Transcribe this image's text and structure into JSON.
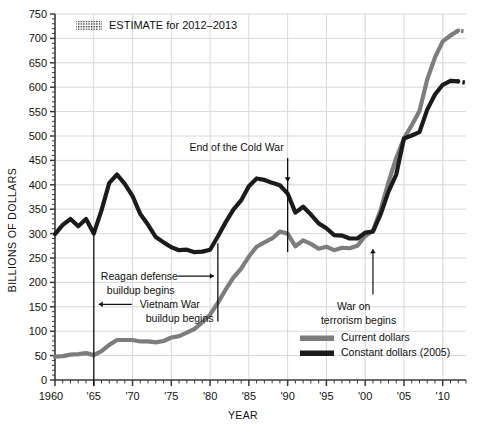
{
  "chart_data": {
    "type": "line",
    "title": "",
    "xlabel": "YEAR",
    "ylabel": "BILLIONS OF DOLLARS",
    "xlim": [
      1960,
      2013
    ],
    "ylim": [
      0,
      750
    ],
    "grid": true,
    "legend_position": "bottom-right",
    "y_ticks": [
      0,
      50,
      100,
      150,
      200,
      250,
      300,
      350,
      400,
      450,
      500,
      550,
      600,
      650,
      700,
      750
    ],
    "y_tick_labels": [
      "0",
      "50",
      "100",
      "150",
      "200",
      "250",
      "300",
      "350",
      "400",
      "450",
      "500",
      "550",
      "600",
      "650",
      "700",
      "750"
    ],
    "x_ticks": [
      1960,
      1965,
      1970,
      1975,
      1980,
      1985,
      1990,
      1995,
      2000,
      2005,
      2010
    ],
    "x_tick_labels": [
      "1960",
      "'65",
      "'70",
      "'75",
      "'80",
      "'85",
      "'90",
      "'95",
      "'00",
      "'05",
      "'10"
    ],
    "x": [
      1960,
      1961,
      1962,
      1963,
      1964,
      1965,
      1966,
      1967,
      1968,
      1969,
      1970,
      1971,
      1972,
      1973,
      1974,
      1975,
      1976,
      1977,
      1978,
      1979,
      1980,
      1981,
      1982,
      1983,
      1984,
      1985,
      1986,
      1987,
      1988,
      1989,
      1990,
      1991,
      1992,
      1993,
      1994,
      1995,
      1996,
      1997,
      1998,
      1999,
      2000,
      2001,
      2002,
      2003,
      2004,
      2005,
      2006,
      2007,
      2008,
      2009,
      2010,
      2011,
      2012,
      2013
    ],
    "series": [
      {
        "name": "Current dollars",
        "color": "#7d7d7d",
        "values": [
          48,
          49,
          52,
          53,
          55,
          51,
          59,
          72,
          82,
          82,
          82,
          79,
          79,
          77,
          80,
          87,
          90,
          97,
          105,
          118,
          134,
          158,
          185,
          210,
          228,
          253,
          273,
          282,
          290,
          304,
          300,
          274,
          286,
          279,
          269,
          273,
          266,
          271,
          270,
          275,
          295,
          306,
          349,
          405,
          455,
          495,
          522,
          551,
          616,
          661,
          694,
          706,
          716,
          714
        ],
        "estimate_from": 2012
      },
      {
        "name": "Constant dollars (2005)",
        "color": "#1b1b1b",
        "values": [
          299,
          318,
          330,
          315,
          330,
          300,
          348,
          404,
          421,
          402,
          377,
          340,
          318,
          293,
          282,
          272,
          266,
          267,
          262,
          263,
          267,
          294,
          323,
          349,
          368,
          397,
          413,
          410,
          404,
          399,
          382,
          343,
          355,
          339,
          321,
          311,
          297,
          296,
          290,
          290,
          302,
          304,
          340,
          386,
          421,
          495,
          501,
          508,
          554,
          585,
          605,
          613,
          612,
          609
        ],
        "estimate_from": 2012
      }
    ],
    "annotations": [
      {
        "id": "estimate-key",
        "label": "ESTIMATE for 2012–2013",
        "type": "pattern-key"
      },
      {
        "id": "vietnam",
        "label_line1": "Vietnam War",
        "label_line2": "buildup begins",
        "year": 1965,
        "arrow": "left"
      },
      {
        "id": "reagan",
        "label_line1": "Reagan defense",
        "label_line2": "buildup begins",
        "year": 1981,
        "arrow": "right"
      },
      {
        "id": "cold-war",
        "label_line1": "End of the Cold War",
        "label_line2": "",
        "year": 1990,
        "arrow": "down"
      },
      {
        "id": "terrorism",
        "label_line1": "War on",
        "label_line2": "terrorism begins",
        "year": 2001,
        "arrow": "up"
      }
    ],
    "legend": [
      {
        "label": "Current dollars",
        "color": "#7d7d7d"
      },
      {
        "label": "Constant dollars (2005)",
        "color": "#1b1b1b"
      }
    ]
  },
  "colors": {
    "background": "#ffffff",
    "grid": "#d8d8d8",
    "axis": "#3a3a3a",
    "text": "#111111",
    "current_dollars": "#7d7d7d",
    "constant_dollars": "#1b1b1b"
  }
}
